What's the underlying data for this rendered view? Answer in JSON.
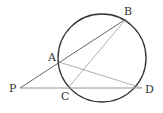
{
  "diagram": {
    "type": "geometry",
    "circle": {
      "cx": 102,
      "cy": 58,
      "r": 44,
      "stroke": "#333333"
    },
    "points": {
      "A": {
        "x": 59,
        "y": 62,
        "label": "A",
        "lx": 48,
        "ly": 61
      },
      "B": {
        "x": 126,
        "y": 19,
        "label": "B",
        "lx": 124,
        "ly": 15
      },
      "C": {
        "x": 68,
        "y": 88,
        "label": "C",
        "lx": 61,
        "ly": 100
      },
      "D": {
        "x": 142,
        "y": 88,
        "label": "D",
        "lx": 145,
        "ly": 93
      },
      "P": {
        "x": 20,
        "y": 88,
        "label": "P",
        "lx": 9,
        "ly": 92
      }
    },
    "segments": [
      {
        "from": "P",
        "to": "B",
        "stroke": "#555555"
      },
      {
        "from": "P",
        "to": "D",
        "stroke": "#888888"
      },
      {
        "from": "A",
        "to": "D",
        "stroke": "#999999"
      },
      {
        "from": "C",
        "to": "B",
        "stroke": "#999999"
      }
    ]
  }
}
